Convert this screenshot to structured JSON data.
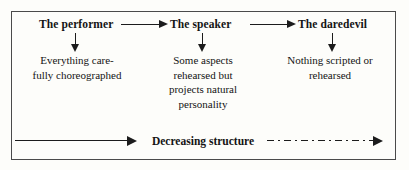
{
  "figure": {
    "background_color": "#fdfdfa",
    "border_color": "#4a4a4a",
    "ink_color": "#1c1c1c"
  },
  "stages": [
    {
      "heading": "The performer",
      "description": "Everything care-\nfully choreographed"
    },
    {
      "heading": "The speaker",
      "description": "Some aspects\nrehearsed but\nprojects natural\npersonality"
    },
    {
      "heading": "The daredevil",
      "description": "Nothing scripted or\nrehearsed"
    }
  ],
  "connectors": {
    "stage_arrow_1": "right-arrow-icon",
    "stage_arrow_2": "right-arrow-icon",
    "down_arrow_1": "down-arrow-icon",
    "down_arrow_2": "down-arrow-icon",
    "down_arrow_3": "down-arrow-icon"
  },
  "axis": {
    "label": "Decreasing structure",
    "left_arrow": "right-arrow-icon",
    "right_arrow": "right-arrow-icon",
    "left_line_style": "solid",
    "right_line_style": "dash-dot"
  }
}
